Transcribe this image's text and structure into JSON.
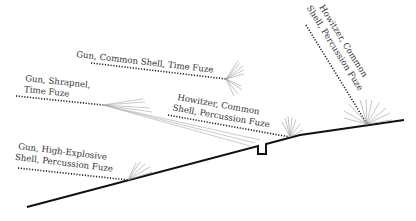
{
  "diagram": {
    "title": "",
    "labels": {
      "gun_common_time": [
        "Gun, Common Shell, Time Fuze"
      ],
      "gun_shrapnel_time": [
        "Gun, Shrapnel,",
        "Time Fuze"
      ],
      "howitzer_common_percussion_low": [
        "Howitzer, Common",
        "Shell, Percussion Fuze"
      ],
      "gun_he_percussion": [
        "Gun, High-Explosive",
        "Shell, Percussion Fuze"
      ],
      "howitzer_common_percussion_steep": [
        "Howitzer, Common",
        "Shell, Percussion Fuze"
      ]
    },
    "elements": [
      "ground-profile",
      "trench",
      "trajectories",
      "burst-patterns"
    ]
  }
}
